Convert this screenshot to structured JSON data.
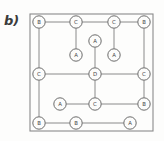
{
  "figure": {
    "panel_label": "b)",
    "frame": {
      "x": 30,
      "y": 14,
      "width": 123,
      "height": 117
    },
    "canvas": {
      "width": 164,
      "height": 141
    },
    "colors": {
      "background": "#fdfdfc",
      "line": "#8a8a8a",
      "node_stroke": "#6b6b6b",
      "node_fill": "#fcfcfb",
      "text": "#4a4a4a",
      "label": "#3b3b3b"
    }
  },
  "chart_data": {
    "type": "diagram",
    "title": "b)",
    "node_radius": 6.2,
    "nodes": [
      {
        "id": "n1",
        "label": "B",
        "x": 39,
        "y": 22
      },
      {
        "id": "n2",
        "label": "C",
        "x": 76,
        "y": 22
      },
      {
        "id": "n3",
        "label": "C",
        "x": 114,
        "y": 22
      },
      {
        "id": "n4",
        "label": "B",
        "x": 144,
        "y": 22
      },
      {
        "id": "n5",
        "label": "A",
        "x": 95,
        "y": 41
      },
      {
        "id": "n6",
        "label": "A",
        "x": 76,
        "y": 55
      },
      {
        "id": "n7",
        "label": "A",
        "x": 114,
        "y": 55
      },
      {
        "id": "n8",
        "label": "C",
        "x": 39,
        "y": 74
      },
      {
        "id": "n9",
        "label": "D",
        "x": 95,
        "y": 74
      },
      {
        "id": "n10",
        "label": "C",
        "x": 144,
        "y": 74
      },
      {
        "id": "n11",
        "label": "A",
        "x": 60,
        "y": 104
      },
      {
        "id": "n12",
        "label": "C",
        "x": 95,
        "y": 104
      },
      {
        "id": "n13",
        "label": "B",
        "x": 144,
        "y": 104
      },
      {
        "id": "n14",
        "label": "B",
        "x": 39,
        "y": 123
      },
      {
        "id": "n15",
        "label": "B",
        "x": 76,
        "y": 123
      },
      {
        "id": "n16",
        "label": "A",
        "x": 130,
        "y": 123
      }
    ],
    "edges": [
      {
        "from": "n1",
        "to": "n2"
      },
      {
        "from": "n2",
        "to": "n3"
      },
      {
        "from": "n3",
        "to": "n4"
      },
      {
        "from": "n2",
        "to": "n6"
      },
      {
        "from": "n3",
        "to": "n7"
      },
      {
        "from": "n5",
        "to": "n9"
      },
      {
        "from": "n1",
        "to": "n8"
      },
      {
        "from": "n8",
        "to": "n9"
      },
      {
        "from": "n9",
        "to": "n10"
      },
      {
        "from": "n4",
        "to": "n10"
      },
      {
        "from": "n9",
        "to": "n12"
      },
      {
        "from": "n11",
        "to": "n12"
      },
      {
        "from": "n12",
        "to": "n13"
      },
      {
        "from": "n10",
        "to": "n13"
      },
      {
        "from": "n8",
        "to": "n14"
      },
      {
        "from": "n14",
        "to": "n15"
      },
      {
        "from": "n15",
        "to": "n16"
      }
    ],
    "node_labels_legend": [
      "A",
      "B",
      "C",
      "D"
    ]
  }
}
